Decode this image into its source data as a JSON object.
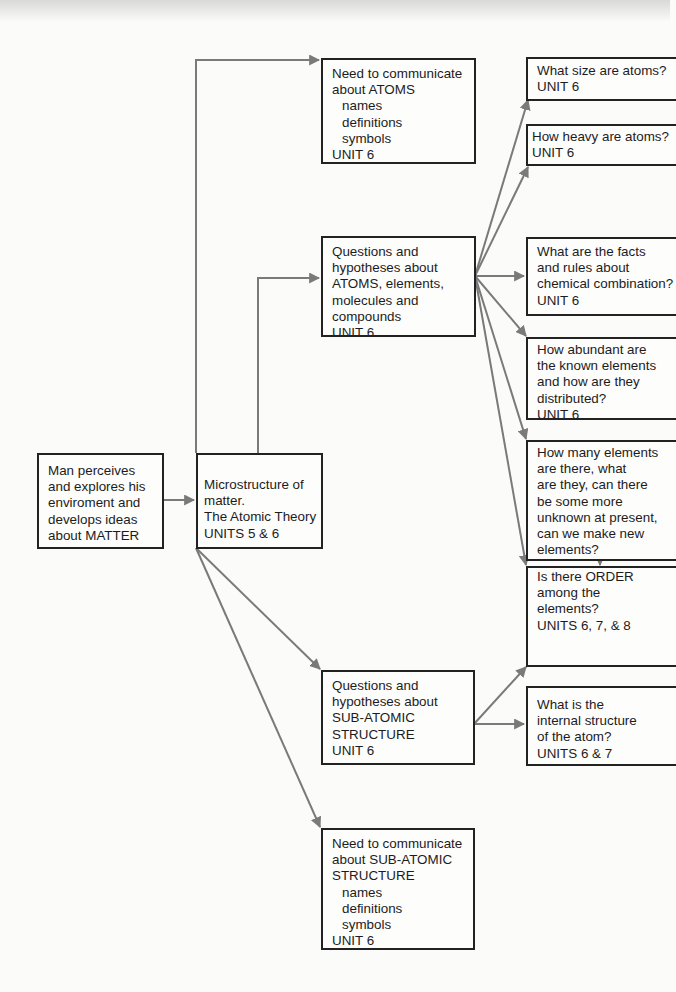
{
  "diagram": {
    "colors": {
      "arrow": "#7a7a7a",
      "border": "#222222",
      "text": "#1c1c1c"
    },
    "nodes": {
      "root": {
        "lines": [
          "Man perceives",
          "and explores his",
          "enviroment and",
          "develops ideas",
          "about MATTER"
        ]
      },
      "micro": {
        "lines": [
          "Microstructure of",
          "matter.",
          "The Atomic Theory",
          "UNITS 5 & 6"
        ]
      },
      "comm_atoms": {
        "lines": [
          "Need to communicate",
          "about ATOMS"
        ],
        "sub": [
          "names",
          "definitions",
          "symbols"
        ],
        "unit": "UNIT 6"
      },
      "q_atoms": {
        "lines": [
          "Questions and",
          "hypotheses about",
          "ATOMS, elements,",
          "molecules and",
          "compounds",
          "UNIT 6"
        ]
      },
      "q_sub": {
        "lines": [
          "Questions and",
          "hypotheses about",
          "SUB-ATOMIC",
          "STRUCTURE",
          "UNIT 6"
        ]
      },
      "comm_sub": {
        "lines": [
          "Need to communicate",
          "about SUB-ATOMIC",
          "STRUCTURE"
        ],
        "sub": [
          "names",
          "definitions",
          "symbols"
        ],
        "unit": "UNIT 6"
      },
      "size": {
        "lines": [
          "What size are atoms?",
          "UNIT 6"
        ]
      },
      "heavy": {
        "lines": [
          "How heavy are atoms?",
          "UNIT 6"
        ]
      },
      "facts": {
        "lines": [
          "What are the facts",
          "and rules about",
          "chemical combination?",
          "UNIT 6"
        ]
      },
      "abundant": {
        "lines": [
          "How abundant are",
          "the known elements",
          "and how are they",
          "distributed?",
          "UNIT 6"
        ]
      },
      "howmany": {
        "lines": [
          "How many elements",
          "are there, what",
          "are they, can there",
          "be some more",
          "unknown at present,",
          "can we make new",
          "elements?",
          "UNIT 6"
        ]
      },
      "order": {
        "lines": [
          "Is there ORDER",
          "among the",
          "elements?",
          "UNITS 6, 7, & 8"
        ]
      },
      "internal": {
        "lines": [
          "What is the",
          "internal structure",
          "of the atom?",
          "UNITS 6 & 7"
        ]
      }
    }
  }
}
